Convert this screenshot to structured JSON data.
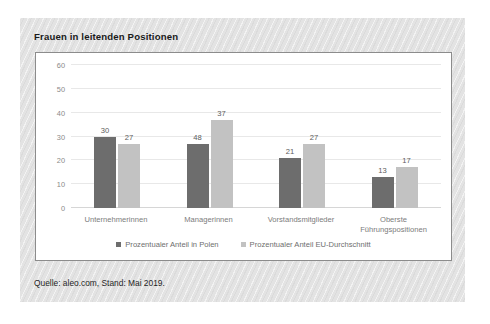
{
  "figure": {
    "title": "Frauen in leitenden Positionen",
    "source_note": "Quelle: aleo.com, Stand: Mai 2019.",
    "panel_bg": "#e3e3e3",
    "plot_bg": "#ffffff",
    "plot_border": "#8c8c8c"
  },
  "chart_data": {
    "type": "bar",
    "title": "Frauen in leitenden Positionen",
    "xlabel": "",
    "ylabel": "",
    "ylim": [
      0,
      60
    ],
    "yticks": [
      0,
      10,
      20,
      30,
      40,
      50,
      60
    ],
    "ytick_labels": [
      "0",
      "10",
      "20",
      "30",
      "40",
      "50",
      "60"
    ],
    "grid": true,
    "grid_axis": "y",
    "legend_position": "bottom",
    "categories": [
      "Unternehmerinnen",
      "Managerinnen",
      "Vorstandsmitglieder",
      "Oberste\nFührungspositionen"
    ],
    "category_lines": [
      [
        "Unternehmerinnen"
      ],
      [
        "Managerinnen"
      ],
      [
        "Vorstandsmitglieder"
      ],
      [
        "Oberste",
        "Führungspositionen"
      ]
    ],
    "series": [
      {
        "name": "Prozentualer Anteil in Polen",
        "color": "#6d6d6d",
        "values": [
          30,
          27,
          21,
          13
        ],
        "labels": [
          "30",
          "48",
          "21",
          "13"
        ]
      },
      {
        "name": "Prozentualer Anteil EU-Durchschnitt",
        "color": "#c2c2c2",
        "values": [
          27,
          37,
          27,
          17
        ],
        "labels": [
          "27",
          "37",
          "27",
          "17"
        ]
      }
    ],
    "bars": [
      {
        "category": "Unternehmerinnen",
        "series": "Prozentualer Anteil in Polen",
        "value": 30,
        "label": "30"
      },
      {
        "category": "Unternehmerinnen",
        "series": "Prozentualer Anteil EU-Durchschnitt",
        "value": 27,
        "label": "27"
      },
      {
        "category": "Managerinnen",
        "series": "Prozentualer Anteil in Polen",
        "value": 48,
        "label": "48"
      },
      {
        "category": "Managerinnen",
        "series": "Prozentualer Anteil EU-Durchschnitt",
        "value": 37,
        "label": "37"
      },
      {
        "category": "Vorstandsmitglieder",
        "series": "Prozentualer Anteil in Polen",
        "value": 21,
        "label": "21"
      },
      {
        "category": "Vorstandsmitglieder",
        "series": "Prozentualer Anteil EU-Durchschnitt",
        "value": 27,
        "label": "27"
      },
      {
        "category": "Oberste Führungspositionen",
        "series": "Prozentualer Anteil in Polen",
        "value": 13,
        "label": "13"
      },
      {
        "category": "Oberste Führungspositionen",
        "series": "Prozentualer Anteil EU-Durchschnitt",
        "value": 17,
        "label": "17"
      }
    ]
  }
}
